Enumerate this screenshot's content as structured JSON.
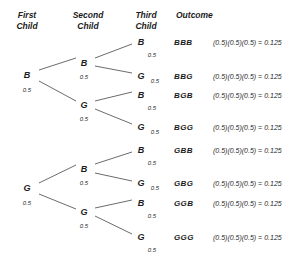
{
  "headers": [
    {
      "label": "First\nChild",
      "x": 27,
      "y": 10
    },
    {
      "label": "Second\nChild",
      "x": 88,
      "y": 10
    },
    {
      "label": "Third\nChild",
      "x": 146,
      "y": 10
    },
    {
      "label": "Outcome",
      "x": 176,
      "y": 10
    }
  ],
  "nodes": [
    {
      "name": "first-child-b",
      "label": "B",
      "x": 27,
      "y": 75
    },
    {
      "name": "first-child-g",
      "label": "G",
      "x": 27,
      "y": 188
    },
    {
      "name": "second-child-b-from-b",
      "label": "B",
      "x": 84,
      "y": 63
    },
    {
      "name": "second-child-g-from-b",
      "label": "G",
      "x": 84,
      "y": 105
    },
    {
      "name": "second-child-b-from-g",
      "label": "B",
      "x": 84,
      "y": 169
    },
    {
      "name": "second-child-g-from-g",
      "label": "G",
      "x": 84,
      "y": 212
    },
    {
      "name": "third-child-bbb",
      "label": "B",
      "x": 141,
      "y": 42
    },
    {
      "name": "third-child-bbg",
      "label": "G",
      "x": 141,
      "y": 76
    },
    {
      "name": "third-child-bgb",
      "label": "B",
      "x": 141,
      "y": 95
    },
    {
      "name": "third-child-bgg",
      "label": "G",
      "x": 141,
      "y": 127
    },
    {
      "name": "third-child-gbb",
      "label": "B",
      "x": 141,
      "y": 150
    },
    {
      "name": "third-child-gbg",
      "label": "G",
      "x": 141,
      "y": 183
    },
    {
      "name": "third-child-ggb",
      "label": "B",
      "x": 141,
      "y": 203
    },
    {
      "name": "third-child-ggg",
      "label": "G",
      "x": 141,
      "y": 237
    }
  ],
  "probabilities": [
    {
      "name": "prob-first-child-b",
      "label": "0.5",
      "x": 27,
      "y": 90
    },
    {
      "name": "prob-first-child-g",
      "label": "0.5",
      "x": 27,
      "y": 203
    },
    {
      "name": "prob-second-child-b-from-b",
      "label": "0.5",
      "x": 84,
      "y": 77
    },
    {
      "name": "prob-second-child-g-from-b",
      "label": "0.5",
      "x": 84,
      "y": 119
    },
    {
      "name": "prob-second-child-b-from-g",
      "label": "0.5",
      "x": 84,
      "y": 183
    },
    {
      "name": "prob-second-child-g-from-g",
      "label": "0.5",
      "x": 84,
      "y": 226
    },
    {
      "name": "prob-third-child-bbb",
      "label": "0.5",
      "x": 152,
      "y": 55
    },
    {
      "name": "prob-third-child-bbg",
      "label": "0.5",
      "x": 155,
      "y": 81
    },
    {
      "name": "prob-third-child-bgb",
      "label": "0.5",
      "x": 152,
      "y": 108
    },
    {
      "name": "prob-third-child-bgg",
      "label": "0.5",
      "x": 155,
      "y": 132
    },
    {
      "name": "prob-third-child-gbb",
      "label": "0.5",
      "x": 152,
      "y": 163
    },
    {
      "name": "prob-third-child-gbg",
      "label": "0.5",
      "x": 155,
      "y": 188
    },
    {
      "name": "prob-third-child-ggb",
      "label": "0.5",
      "x": 152,
      "y": 216
    },
    {
      "name": "prob-third-child-ggg",
      "label": "0.5",
      "x": 152,
      "y": 250
    }
  ],
  "outcomes": [
    {
      "name": "outcome-bbb",
      "label": "BBB",
      "formula": "(0.5)(0.5)(0.5) = 0.125",
      "y": 42
    },
    {
      "name": "outcome-bbg",
      "label": "BBG",
      "formula": "(0.5)(0.5)(0.5) = 0.125",
      "y": 76
    },
    {
      "name": "outcome-bgb",
      "label": "BGB",
      "formula": "(0.5)(0.5)(0.5) = 0.125",
      "y": 95
    },
    {
      "name": "outcome-bgg",
      "label": "BGG",
      "formula": "(0.5)(0.5)(0.5) = 0.125",
      "y": 127
    },
    {
      "name": "outcome-gbb",
      "label": "GBB",
      "formula": "(0.5)(0.5)(0.5) = 0.125",
      "y": 150
    },
    {
      "name": "outcome-gbg",
      "label": "GBG",
      "formula": "(0.5)(0.5)(0.5) = 0.125",
      "y": 183
    },
    {
      "name": "outcome-ggb",
      "label": "GGB",
      "formula": "(0.5)(0.5)(0.5) = 0.125",
      "y": 203
    },
    {
      "name": "outcome-ggg",
      "label": "GGG",
      "formula": "(0.5)(0.5)(0.5) = 0.125",
      "y": 237
    }
  ],
  "outcome_label_x": 174,
  "formula_x": 213,
  "edges": [
    {
      "name": "edge-root-to-b",
      "x1": 39,
      "y1": 70,
      "x2": 76,
      "y2": 58
    },
    {
      "name": "edge-root-to-g",
      "x1": 39,
      "y1": 81,
      "x2": 76,
      "y2": 101
    },
    {
      "name": "edge-b-to-bb",
      "x1": 95,
      "y1": 58,
      "x2": 132,
      "y2": 44
    },
    {
      "name": "edge-b-to-bg",
      "x1": 95,
      "y1": 66,
      "x2": 132,
      "y2": 73
    },
    {
      "name": "edge-g-to-gb",
      "x1": 95,
      "y1": 101,
      "x2": 132,
      "y2": 92
    },
    {
      "name": "edge-g-to-gg",
      "x1": 95,
      "y1": 109,
      "x2": 132,
      "y2": 124
    },
    {
      "name": "edge-root-to-b2",
      "x1": 39,
      "y1": 183,
      "x2": 76,
      "y2": 165
    },
    {
      "name": "edge-root-to-g2",
      "x1": 39,
      "y1": 194,
      "x2": 76,
      "y2": 209
    },
    {
      "name": "edge-b2-to-bb2",
      "x1": 95,
      "y1": 164,
      "x2": 132,
      "y2": 152
    },
    {
      "name": "edge-b2-to-bg2",
      "x1": 95,
      "y1": 173,
      "x2": 132,
      "y2": 181
    },
    {
      "name": "edge-g2-to-gb2",
      "x1": 95,
      "y1": 208,
      "x2": 132,
      "y2": 200
    },
    {
      "name": "edge-g2-to-gg2",
      "x1": 95,
      "y1": 216,
      "x2": 132,
      "y2": 234
    }
  ],
  "style": {
    "edge_color": "#5a5a5a",
    "text_color": "#1b1b1b",
    "background": "#ffffff"
  }
}
